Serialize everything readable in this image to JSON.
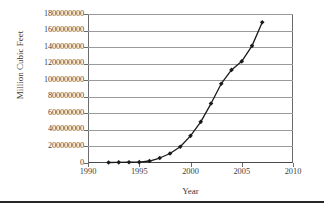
{
  "chart_data": {
    "type": "line",
    "title": "",
    "xlabel": "Year",
    "ylabel": "Million Cubic Feet",
    "xlim": [
      1990,
      2010
    ],
    "ylim": [
      0,
      1800000000
    ],
    "grid": true,
    "legend": null,
    "x_ticks": [
      "1990",
      "1995",
      "2000",
      "2005",
      "2010"
    ],
    "x_tick_values": [
      1990,
      1995,
      2000,
      2005,
      2010
    ],
    "y_ticks": [
      "0",
      "200000000",
      "400000000",
      "600000000",
      "800000000",
      "1000000000",
      "1200000000",
      "1400000000",
      "1600000000",
      "1800000000"
    ],
    "y_tick_values": [
      0,
      200000000,
      400000000,
      600000000,
      800000000,
      1000000000,
      1200000000,
      1400000000,
      1600000000,
      1800000000
    ],
    "marker": "diamond",
    "marker_color": "#1a1a1a",
    "line_color": "#1a1a1a",
    "x": [
      1992,
      1993,
      1994,
      1995,
      1996,
      1997,
      1998,
      1999,
      2000,
      2001,
      2002,
      2003,
      2004,
      2005,
      2006,
      2007
    ],
    "values": [
      6000000,
      8000000,
      9000000,
      10000000,
      24000000,
      60000000,
      115000000,
      196000000,
      328000000,
      497000000,
      718000000,
      958000000,
      1125000000,
      1228000000,
      1415000000,
      1700000000
    ],
    "series": [
      {
        "name": "Million Cubic Feet",
        "values": [
          6000000,
          8000000,
          9000000,
          10000000,
          24000000,
          60000000,
          115000000,
          196000000,
          328000000,
          497000000,
          718000000,
          958000000,
          1125000000,
          1228000000,
          1415000000,
          1700000000
        ]
      }
    ]
  }
}
